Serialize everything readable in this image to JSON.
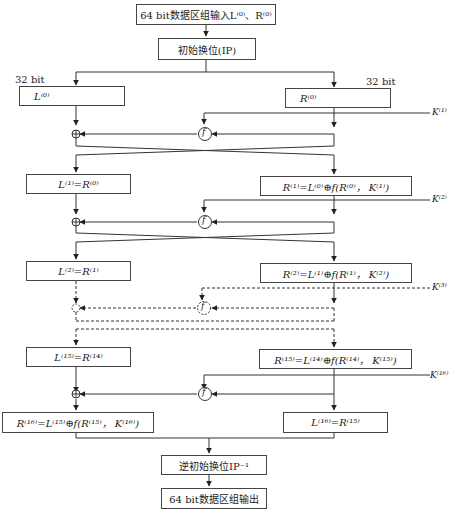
{
  "diagram": {
    "title_input": "64 bit数据区组输入L⁽⁰⁾、R⁽⁰⁾",
    "ip": "初始换位(IP)",
    "bit_left": "32 bit",
    "bit_right": "32 bit",
    "L0": "L⁽⁰⁾",
    "R0": "R⁽⁰⁾",
    "K1": "K⁽¹⁾",
    "K2": "K⁽²⁾",
    "K3": "K⁽³⁾",
    "K16": "K⁽¹⁶⁾",
    "f_label": "f",
    "xor_symbol": "⊕",
    "L1": "L⁽¹⁾=R⁽⁰⁾",
    "R1": "R⁽¹⁾=L⁽⁰⁾⊕f(R⁽⁰⁾， K⁽¹⁾)",
    "L2": "L⁽²⁾=R⁽¹⁾",
    "R2": "R⁽²⁾=L⁽¹⁾⊕f(R⁽¹⁾， K⁽²⁾)",
    "L15": "L⁽¹⁵⁾=R⁽¹⁴⁾",
    "R15": "R⁽¹⁵⁾=L⁽¹⁴⁾⊕f(R⁽¹⁴⁾， K⁽¹⁵⁾)",
    "R16": "R⁽¹⁶⁾=L⁽¹⁵⁾⊕f(R⁽¹⁵⁾， K⁽¹⁶⁾)",
    "L16": "L⁽¹⁶⁾=R⁽¹⁵⁾",
    "ip_inverse": "逆初始换位IP⁻¹",
    "output": "64 bit数据区组输出"
  }
}
